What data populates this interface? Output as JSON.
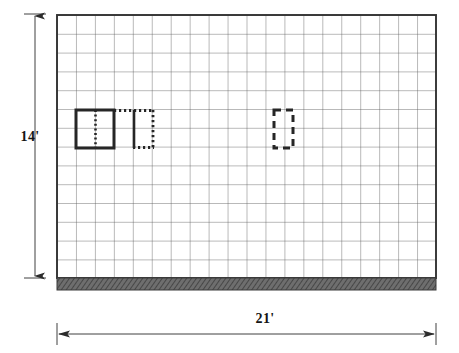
{
  "drawing": {
    "title": "Masonry wall elevation with grid coursing",
    "kind": "construction-elevation",
    "background_color": "#ffffff",
    "ink_color": "#2b2b2b",
    "grid_line_color": "#555555",
    "border_color": "#333333",
    "ground_fill_color": "#5a5a5a"
  },
  "dimensions": {
    "height": {
      "label": "14'",
      "value": 14,
      "unit": "ft",
      "orientation": "vertical",
      "position": "left"
    },
    "width": {
      "label": "21'",
      "value": 21,
      "unit": "ft",
      "orientation": "horizontal",
      "position": "bottom"
    }
  },
  "grid": {
    "columns": 20,
    "rows": 14,
    "origin_x": 57,
    "origin_y": 15,
    "cell_width": 18.95,
    "cell_height": 18.8,
    "line_color": "#5b5b5b",
    "line_width": 0.8,
    "border_width": 1.9
  },
  "ground": {
    "top": 278,
    "height": 12,
    "left": 57,
    "right": 436,
    "style": "hatched-solid-band",
    "color": "#5a5a5a"
  },
  "openings": [
    {
      "name": "existing-opening-solid",
      "line_style": "solid",
      "columns_wide": 2,
      "rows_tall": 2,
      "x": 76,
      "y": 110,
      "width": 38,
      "height": 38,
      "stroke_width": 3,
      "has_center_mullion": true,
      "mullion_style": "dotted"
    },
    {
      "name": "proposed-opening-dotted",
      "line_style": "dotted",
      "columns_wide": 2,
      "rows_tall": 2,
      "x": 115,
      "y": 110,
      "width": 39,
      "height": 38,
      "stroke_width": 3,
      "has_center_mullion": true,
      "mullion_style": "solid"
    },
    {
      "name": "proposed-opening-dashed",
      "line_style": "dashed",
      "columns_wide": 1,
      "rows_tall": 2,
      "x": 274,
      "y": 110,
      "width": 19,
      "height": 38,
      "stroke_width": 3,
      "has_center_mullion": false,
      "mullion_style": "none"
    }
  ],
  "dimension_lines": {
    "vertical": {
      "x": 35,
      "y_top": 15,
      "y_bottom": 278,
      "arrow_top": true,
      "arrow_bottom": true,
      "tick_width": 22
    },
    "horizontal": {
      "y": 334,
      "x_left": 57,
      "x_right": 436,
      "arrow_left": true,
      "arrow_right": true,
      "tick_height": 22
    }
  }
}
